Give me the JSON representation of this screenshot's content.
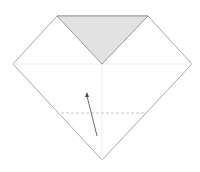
{
  "diagram": {
    "type": "origami-step",
    "colors": {
      "background": "#ffffff",
      "outline": "#a8a8a8",
      "flap_fill": "#e2e2e2",
      "crease": "#ececec",
      "valley_line": "#c8c8c8",
      "arrow": "#6a6a6a"
    },
    "shape": {
      "outline_points": "57,16 148,16 192,64 102,160 13,64",
      "flap_points": "57,16 148,16 102,64"
    },
    "creases": {
      "horizontal": {
        "x1": 13,
        "y1": 64,
        "x2": 192,
        "y2": 64
      },
      "vertical": {
        "x1": 102,
        "y1": 64,
        "x2": 102,
        "y2": 160
      }
    },
    "valley_fold": {
      "x1": 61,
      "y1": 113,
      "x2": 145,
      "y2": 113
    },
    "fold_arrow": {
      "path": "M97,136 Q92,116 87,96",
      "head": "87,92 85,97 89,97"
    }
  }
}
